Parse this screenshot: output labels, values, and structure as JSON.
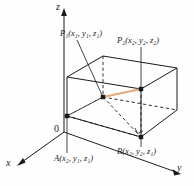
{
  "figure": {
    "type": "3d-coordinate-box-diagram",
    "background_color": "#fefefe",
    "line_color": "#1a1a1a",
    "segment_color": "#e8a978",
    "axes": [
      {
        "name": "x",
        "label": "x",
        "direction": "lower-left"
      },
      {
        "name": "y",
        "label": "y",
        "direction": "lower-right"
      },
      {
        "name": "z",
        "label": "z",
        "direction": "up"
      }
    ],
    "origin": {
      "label": "0"
    },
    "points": [
      {
        "name": "P1",
        "base": "P",
        "base_sub": "1",
        "coords": [
          {
            "var": "x",
            "sub": "1"
          },
          {
            "var": "y",
            "sub": "1"
          },
          {
            "var": "z",
            "sub": "1"
          }
        ]
      },
      {
        "name": "P2",
        "base": "P",
        "base_sub": "2",
        "coords": [
          {
            "var": "x",
            "sub": "2"
          },
          {
            "var": "y",
            "sub": "2"
          },
          {
            "var": "z",
            "sub": "2"
          }
        ]
      },
      {
        "name": "A",
        "base": "A",
        "base_sub": "",
        "coords": [
          {
            "var": "x",
            "sub": "2"
          },
          {
            "var": "y",
            "sub": "1"
          },
          {
            "var": "z",
            "sub": "1"
          }
        ]
      },
      {
        "name": "B",
        "base": "B",
        "base_sub": "",
        "coords": [
          {
            "var": "x",
            "sub": "2"
          },
          {
            "var": "y",
            "sub": "2"
          },
          {
            "var": "z",
            "sub": "1"
          }
        ]
      }
    ],
    "labels": {
      "z_axis": "z",
      "y_axis": "y",
      "x_axis": "x",
      "origin": "0",
      "p1": "P₁(x₁, y₁, z₁)",
      "p2": "P₂(x₂, y₂, z₂)",
      "a": "A(x₂, y₁, z₁)",
      "b": "B(x₂, y₂, z₁)"
    }
  }
}
